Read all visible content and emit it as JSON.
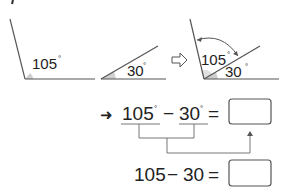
{
  "figure1": {
    "angle": "105",
    "degree": "°"
  },
  "figure2": {
    "angle": "30",
    "degree": "°"
  },
  "arrow_symbol": "⇨",
  "figure3": {
    "angle_big": "105",
    "angle_small": "30",
    "degree": "°"
  },
  "equation1": {
    "arrow": "➜",
    "a": "105",
    "minus": "−",
    "b": "30",
    "equals": "=",
    "degree": "°"
  },
  "equation2": {
    "a": "105",
    "minus": "−",
    "b": "30",
    "equals": "="
  },
  "colors": {
    "line": "#555555",
    "shade": "#cfcfcf",
    "arrow": "#999999",
    "box": "#555555"
  }
}
